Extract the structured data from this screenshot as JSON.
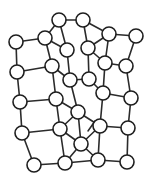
{
  "figure": {
    "background_color": "#ffffff",
    "node_fill_color": "#ffffff",
    "node_stroke_color": "#1e1e1e",
    "edge_color": "#2b2b2b",
    "node_radius": 7,
    "node_count": 34,
    "edge_count": 57,
    "width": 152,
    "height": 183
  },
  "nodes": [
    {
      "id": "n1",
      "label": "",
      "x": 59,
      "y": 20
    },
    {
      "id": "n2",
      "label": "",
      "x": 83,
      "y": 20
    },
    {
      "id": "n3",
      "label": "",
      "x": 45,
      "y": 38
    },
    {
      "id": "n4",
      "label": "",
      "x": 109,
      "y": 34
    },
    {
      "id": "n5",
      "label": "",
      "x": 136,
      "y": 36
    },
    {
      "id": "n6",
      "label": "",
      "x": 16,
      "y": 42
    },
    {
      "id": "n7",
      "label": "",
      "x": 67,
      "y": 50
    },
    {
      "id": "n8",
      "label": "",
      "x": 88,
      "y": 48
    },
    {
      "id": "n9",
      "label": "",
      "x": 52,
      "y": 66
    },
    {
      "id": "n10",
      "label": "",
      "x": 105,
      "y": 63
    },
    {
      "id": "n11",
      "label": "",
      "x": 17,
      "y": 72
    },
    {
      "id": "n12",
      "label": "",
      "x": 126,
      "y": 66
    },
    {
      "id": "n13",
      "label": "",
      "x": 70,
      "y": 80
    },
    {
      "id": "n14",
      "label": "",
      "x": 89,
      "y": 79
    },
    {
      "id": "n15",
      "label": "",
      "x": 56,
      "y": 99
    },
    {
      "id": "n16",
      "label": "",
      "x": 103,
      "y": 93
    },
    {
      "id": "n17",
      "label": "",
      "x": 20,
      "y": 102
    },
    {
      "id": "n18",
      "label": "",
      "x": 131,
      "y": 98
    },
    {
      "id": "n19",
      "label": "",
      "x": 78,
      "y": 112
    },
    {
      "id": "n20",
      "label": "",
      "x": 60,
      "y": 129
    },
    {
      "id": "n21",
      "label": "",
      "x": 100,
      "y": 126
    },
    {
      "id": "n22",
      "label": "",
      "x": 22,
      "y": 133
    },
    {
      "id": "n23",
      "label": "",
      "x": 128,
      "y": 128
    },
    {
      "id": "n24",
      "label": "",
      "x": 81,
      "y": 144
    },
    {
      "id": "n25",
      "label": "",
      "x": 34,
      "y": 165
    },
    {
      "id": "n26",
      "label": "",
      "x": 65,
      "y": 163
    },
    {
      "id": "n27",
      "label": "",
      "x": 98,
      "y": 160
    },
    {
      "id": "n28",
      "label": "",
      "x": 127,
      "y": 162
    }
  ],
  "edges": [
    {
      "source": "n1",
      "target": "n2"
    },
    {
      "source": "n1",
      "target": "n3"
    },
    {
      "source": "n1",
      "target": "n7"
    },
    {
      "source": "n2",
      "target": "n4"
    },
    {
      "source": "n2",
      "target": "n8"
    },
    {
      "source": "n3",
      "target": "n6"
    },
    {
      "source": "n3",
      "target": "n7"
    },
    {
      "source": "n3",
      "target": "n9"
    },
    {
      "source": "n4",
      "target": "n5"
    },
    {
      "source": "n4",
      "target": "n8"
    },
    {
      "source": "n4",
      "target": "n10"
    },
    {
      "source": "n5",
      "target": "n12"
    },
    {
      "source": "n6",
      "target": "n11"
    },
    {
      "source": "n7",
      "target": "n13"
    },
    {
      "source": "n8",
      "target": "n14"
    },
    {
      "source": "n8",
      "target": "n10"
    },
    {
      "source": "n9",
      "target": "n13"
    },
    {
      "source": "n9",
      "target": "n15"
    },
    {
      "source": "n10",
      "target": "n12"
    },
    {
      "source": "n10",
      "target": "n16"
    },
    {
      "source": "n11",
      "target": "n17"
    },
    {
      "source": "n11",
      "target": "n9"
    },
    {
      "source": "n12",
      "target": "n18"
    },
    {
      "source": "n13",
      "target": "n14"
    },
    {
      "source": "n13",
      "target": "n19"
    },
    {
      "source": "n14",
      "target": "n16"
    },
    {
      "source": "n15",
      "target": "n19"
    },
    {
      "source": "n15",
      "target": "n20"
    },
    {
      "source": "n16",
      "target": "n18"
    },
    {
      "source": "n16",
      "target": "n21"
    },
    {
      "source": "n17",
      "target": "n22"
    },
    {
      "source": "n17",
      "target": "n15"
    },
    {
      "source": "n18",
      "target": "n23"
    },
    {
      "source": "n19",
      "target": "n20"
    },
    {
      "source": "n19",
      "target": "n21"
    },
    {
      "source": "n19",
      "target": "n24"
    },
    {
      "source": "n20",
      "target": "n24"
    },
    {
      "source": "n20",
      "target": "n26"
    },
    {
      "source": "n21",
      "target": "n23"
    },
    {
      "source": "n21",
      "target": "n24"
    },
    {
      "source": "n22",
      "target": "n25"
    },
    {
      "source": "n22",
      "target": "n20"
    },
    {
      "source": "n23",
      "target": "n28"
    },
    {
      "source": "n24",
      "target": "n26"
    },
    {
      "source": "n24",
      "target": "n27"
    },
    {
      "source": "n25",
      "target": "n26"
    },
    {
      "source": "n26",
      "target": "n27"
    },
    {
      "source": "n27",
      "target": "n28"
    },
    {
      "source": "n27",
      "target": "n21"
    }
  ],
  "stub_edges": [
    {
      "id": "s1",
      "x1": 88,
      "y1": 131,
      "x2": 95,
      "y2": 121
    }
  ]
}
